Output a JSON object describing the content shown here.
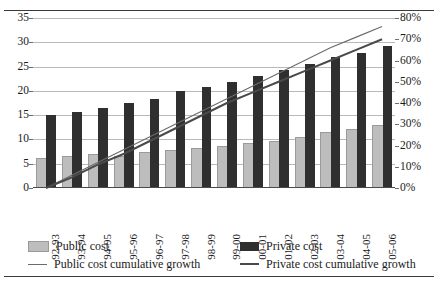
{
  "chart_data": {
    "type": "bar",
    "title": "",
    "subtitle": "",
    "xlabel": "",
    "ylabel": "",
    "y2label": "",
    "grid": true,
    "legend_position": "bottom",
    "categories": [
      "92-93",
      "93-94",
      "94-95",
      "95-96",
      "96-97",
      "97-98",
      "98-99",
      "99-00",
      "00-01",
      "01-02",
      "02-03",
      "03-04",
      "04-05",
      "05-06"
    ],
    "ylim": [
      0,
      35
    ],
    "yticks": [
      "0",
      "5",
      "10",
      "15",
      "20",
      "25",
      "30",
      "35"
    ],
    "ytick_values": [
      0,
      5,
      10,
      15,
      20,
      25,
      30,
      35
    ],
    "y2lim": [
      0,
      80
    ],
    "y2ticks": [
      "0%",
      "10%",
      "20%",
      "30%",
      "40%",
      "50%",
      "60%",
      "70%",
      "80%"
    ],
    "y2tick_values": [
      0,
      10,
      20,
      30,
      40,
      50,
      60,
      70,
      80
    ],
    "series": [
      {
        "name": "Public cost",
        "kind": "bar",
        "axis": "left",
        "color": "#bdbdbd",
        "values": [
          5.7,
          6.1,
          6.6,
          6.2,
          7.1,
          7.5,
          7.9,
          8.2,
          8.8,
          9.2,
          10.1,
          11.1,
          11.7,
          12.5
        ]
      },
      {
        "name": "Private cost",
        "kind": "bar",
        "axis": "left",
        "color": "#2f2f2f",
        "values": [
          15.0,
          15.7,
          16.5,
          17.5,
          18.4,
          20.0,
          20.8,
          21.9,
          23.1,
          24.2,
          25.6,
          27.0,
          27.8,
          29.2
        ]
      },
      {
        "name": "Public cost cumulative growth",
        "kind": "line",
        "axis": "right",
        "color": "#6b6b6b",
        "values": [
          0,
          6,
          12,
          18,
          24,
          30,
          36,
          42,
          48,
          54,
          60,
          66,
          71,
          76
        ]
      },
      {
        "name": "Private cost cumulative growth",
        "kind": "line",
        "axis": "right",
        "color": "#4a4a4a",
        "values": [
          0,
          5,
          11,
          16,
          22,
          28,
          34,
          40,
          45,
          50,
          55,
          60,
          65,
          70
        ]
      }
    ],
    "legend_entries": [
      {
        "label": "Public cost",
        "marker": "swatch-light"
      },
      {
        "label": "Private cost",
        "marker": "swatch-dark"
      },
      {
        "label": "Public cost cumulative growth",
        "marker": "line-thin"
      },
      {
        "label": "Private cost cumulative growth",
        "marker": "line-thick"
      }
    ]
  }
}
